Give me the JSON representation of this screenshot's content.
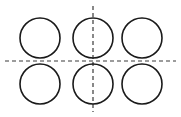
{
  "figure": {
    "background_color": "#ffffff",
    "width": 181,
    "height": 117
  },
  "style": {
    "circle_stroke_color": "#1a1a1a",
    "circle_stroke_width": 1.6,
    "circle_fill": "none",
    "centerline_color": "#3a3a3a",
    "centerline_stroke_width": 1.2,
    "centerline_dash_pattern": "4 3"
  },
  "chart_data": {
    "type": "scatter",
    "title": "",
    "xlabel": "",
    "ylabel": "",
    "grid": false,
    "legend": null,
    "xlim": [
      0,
      181
    ],
    "ylim": [
      0,
      117
    ],
    "circles": [
      {
        "name": "circle-top-left",
        "cx": 40,
        "cy": 38,
        "r": 20
      },
      {
        "name": "circle-top-center",
        "cx": 93,
        "cy": 38,
        "r": 20
      },
      {
        "name": "circle-top-right",
        "cx": 142,
        "cy": 38,
        "r": 20
      },
      {
        "name": "circle-bottom-left",
        "cx": 40,
        "cy": 84,
        "r": 20
      },
      {
        "name": "circle-bottom-center",
        "cx": 93,
        "cy": 84,
        "r": 20
      },
      {
        "name": "circle-bottom-right",
        "cx": 142,
        "cy": 84,
        "r": 20
      }
    ],
    "centerlines": [
      {
        "name": "horizontal-centerline",
        "orientation": "horizontal",
        "x1": 5,
        "y1": 61,
        "x2": 176,
        "y2": 61
      },
      {
        "name": "vertical-centerline",
        "orientation": "vertical",
        "x1": 93,
        "y1": 6,
        "x2": 93,
        "y2": 112
      }
    ]
  }
}
